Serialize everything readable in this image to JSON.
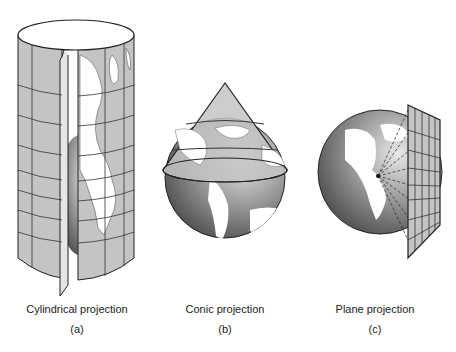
{
  "figure": {
    "panels": [
      {
        "id": "a",
        "title": "Cylindrical projection",
        "letter": "(a)",
        "shape": "cylinder"
      },
      {
        "id": "b",
        "title": "Conic projection",
        "letter": "(b)",
        "shape": "cone"
      },
      {
        "id": "c",
        "title": "Plane projection",
        "letter": "(c)",
        "shape": "plane"
      }
    ]
  },
  "colors": {
    "surface": "#c4c4c4",
    "land": "#ffffff",
    "outline": "#222222",
    "globe_dark": "#5a5a5a",
    "globe_light": "#d8d8d8"
  }
}
